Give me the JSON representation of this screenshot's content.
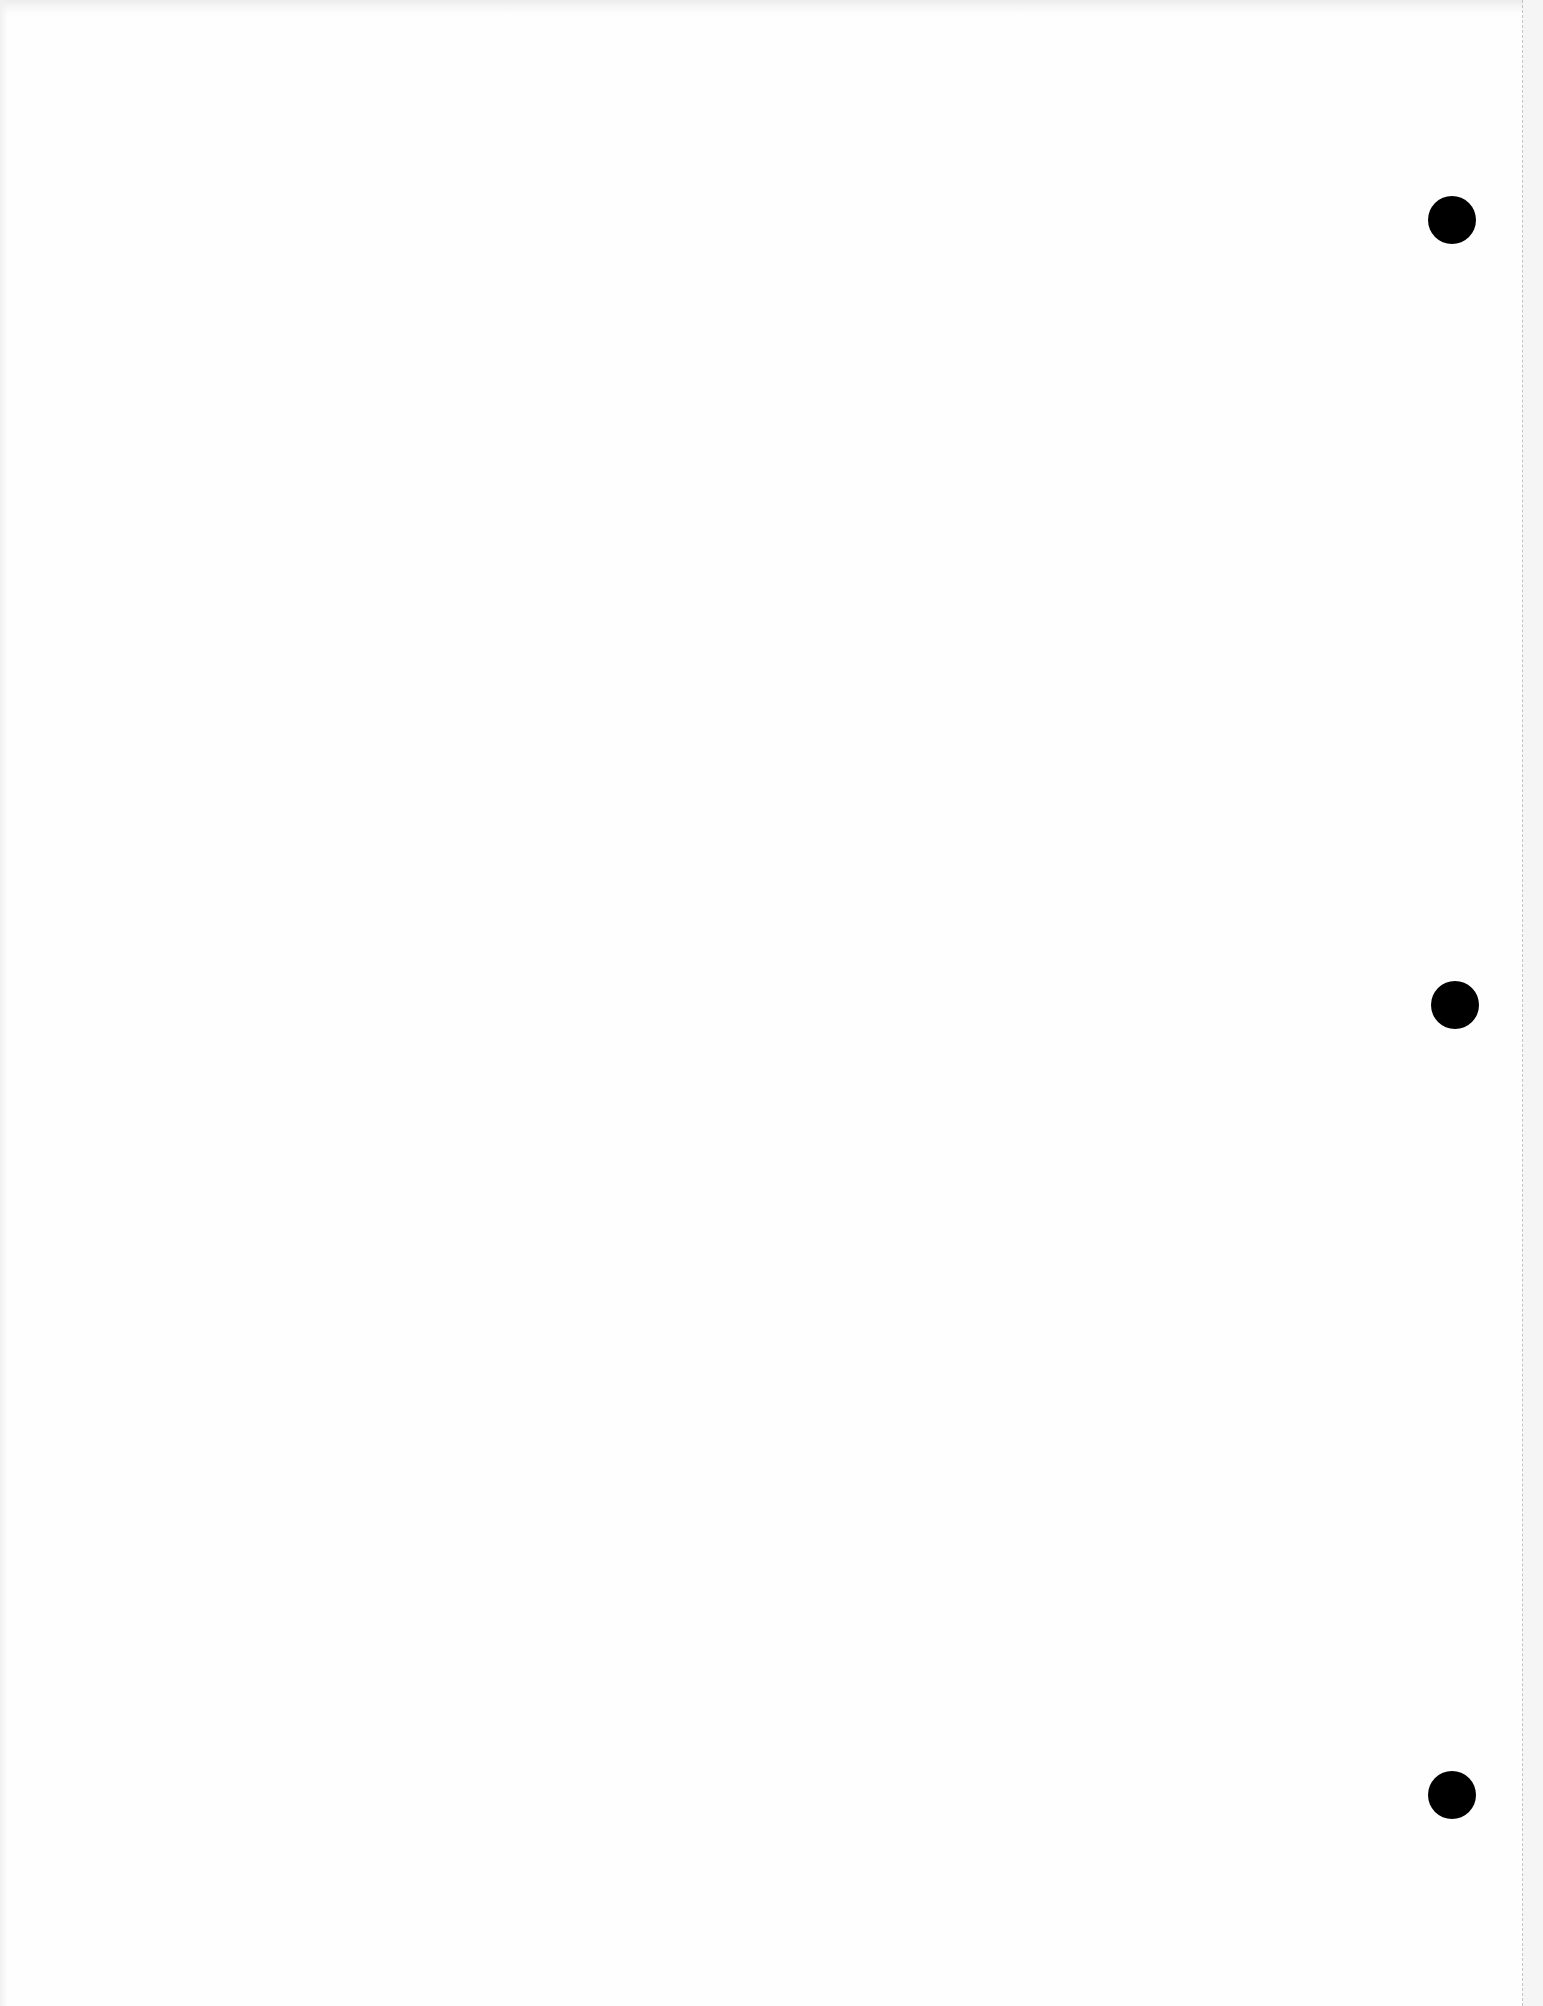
{
  "page": {
    "type": "blank-hole-punched-sheet",
    "background_color": "#fefefe",
    "content_text": ""
  },
  "punch_holes": [
    {
      "cx": 1452,
      "cy": 220,
      "diameter": 48,
      "color": "#000000"
    },
    {
      "cx": 1455,
      "cy": 1005,
      "diameter": 48,
      "color": "#000000"
    },
    {
      "cx": 1452,
      "cy": 1795,
      "diameter": 48,
      "color": "#000000"
    }
  ],
  "perforation": {
    "x": 1522,
    "style": "dashed",
    "color": "#c4c4c4",
    "strip_color": "#f5f5f5"
  }
}
